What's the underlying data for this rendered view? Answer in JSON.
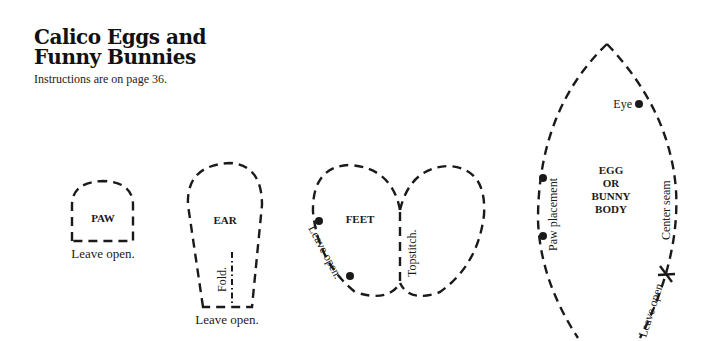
{
  "header": {
    "title_line1": "Calico Eggs and",
    "title_line2": "Funny Bunnies",
    "subtitle": "Instructions are on page 36."
  },
  "pieces": {
    "paw": {
      "name": "PAW",
      "note": "Leave open."
    },
    "ear": {
      "name": "EAR",
      "fold": "Fold.",
      "note": "Leave open."
    },
    "feet": {
      "name": "FEET",
      "leave_open": "Leave open.",
      "topstitch": "Topstitch."
    },
    "body": {
      "name_line1": "EGG",
      "name_line2": "OR",
      "name_line3": "BUNNY",
      "name_line4": "BODY",
      "eye": "Eye",
      "paw_placement": "Paw placement",
      "center_seam": "Center seam",
      "leave_open": "Leave open."
    }
  },
  "colors": {
    "ink": "#1a1a1a",
    "paper": "#ffffff"
  }
}
